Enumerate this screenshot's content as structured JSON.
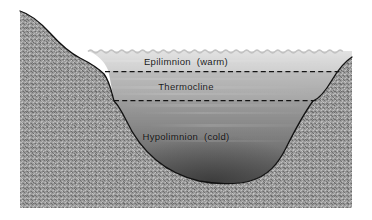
{
  "figure": {
    "background_color": "#ffffff"
  },
  "colors": {
    "terrain": "#949494",
    "terrain_outline": "#101010",
    "epilimnion": "#d9d9d9",
    "thermocline": "#b2b2b2",
    "hypolimnion_top": "#8f8f8f",
    "hypolimnion_bottom": "#3f3f3f",
    "dashed_line": "#141414",
    "label_text": "#1a1a1a"
  },
  "labels": {
    "epilimnion": "Epilimnion  (warm)",
    "thermocline": "Thermocline",
    "hypolimnion": "Hypolimnion  (cold)"
  },
  "icons": {
    "water_surface": "wavy-surface-icon",
    "boundary_upper": "dashed-boundary-icon",
    "boundary_lower": "dashed-boundary-icon",
    "sediment": "stipple-texture-icon"
  }
}
